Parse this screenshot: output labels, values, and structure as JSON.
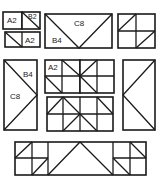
{
  "diagram": {
    "colors": {
      "stroke": "#1a1a1a",
      "background": "#ffffff",
      "label": "#222222"
    },
    "panels": [
      {
        "id": "top-left-group",
        "labels": [
          "A2",
          "B2",
          "A2"
        ]
      },
      {
        "id": "top-center-box",
        "labels": [
          "C8",
          "B4"
        ]
      },
      {
        "id": "top-right-grid",
        "labels": []
      },
      {
        "id": "mid-left-tall",
        "labels": [
          "B4",
          "C8"
        ]
      },
      {
        "id": "mid-center-grid-a",
        "labels": [
          "A2"
        ]
      },
      {
        "id": "mid-center-grid-b",
        "labels": []
      },
      {
        "id": "mid-center-lower-grid",
        "labels": []
      },
      {
        "id": "mid-right-tall",
        "labels": []
      },
      {
        "id": "bottom-strip",
        "labels": []
      }
    ]
  }
}
